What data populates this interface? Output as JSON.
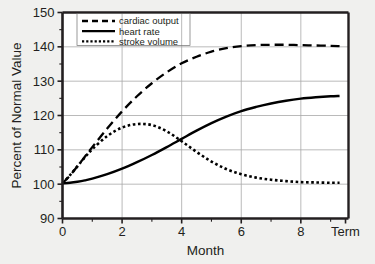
{
  "figure": {
    "background_color": "#f0f0ee",
    "plot_background_color": "#ffffff",
    "axis_color": "#231f20",
    "grid_color": "#a8a8a8"
  },
  "legend": {
    "position": "top-left-inside",
    "border": true,
    "items": [
      {
        "label": "cardiac output",
        "style": "dashed",
        "color": "#000000"
      },
      {
        "label": "heart rate",
        "style": "solid",
        "color": "#000000"
      },
      {
        "label": "stroke volume",
        "style": "dotted",
        "color": "#000000"
      }
    ]
  },
  "chart_data": {
    "type": "line",
    "title": "",
    "subtitle": "",
    "xlabel": "Month",
    "ylabel": "Percent of Normal Value",
    "xlim": [
      0,
      9.6
    ],
    "ylim": [
      90,
      150
    ],
    "yticks": [
      90,
      100,
      110,
      120,
      130,
      140,
      150
    ],
    "ytick_labels": [
      "90",
      "100",
      "110",
      "120",
      "130",
      "140",
      "150"
    ],
    "xticks": [
      0,
      2,
      4,
      6,
      8,
      9.5
    ],
    "xtick_labels": [
      "0",
      "2",
      "4",
      "6",
      "8",
      "Term"
    ],
    "xminor_ticks": [
      1,
      3,
      5,
      7,
      9
    ],
    "grid": true,
    "grid_axis": "both",
    "legend_position": "upper left",
    "series": [
      {
        "name": "cardiac output",
        "style": "dashed",
        "color": "#000000",
        "x": [
          0,
          0.25,
          0.5,
          0.75,
          1,
          1.5,
          2,
          2.5,
          3,
          3.5,
          4,
          4.5,
          5,
          5.5,
          6,
          6.5,
          7,
          7.5,
          8,
          8.5,
          9,
          9.3
        ],
        "y": [
          100.3,
          102.5,
          105.2,
          108.0,
          110.8,
          116.2,
          121.2,
          125.6,
          129.4,
          132.6,
          135.2,
          137.1,
          138.6,
          139.6,
          140.2,
          140.5,
          140.6,
          140.6,
          140.5,
          140.4,
          140.3,
          140.2
        ]
      },
      {
        "name": "heart rate",
        "style": "solid",
        "color": "#000000",
        "x": [
          0,
          0.25,
          0.5,
          0.75,
          1,
          1.5,
          2,
          2.5,
          3,
          3.5,
          4,
          4.5,
          5,
          5.5,
          6,
          6.5,
          7,
          7.5,
          8,
          8.5,
          9,
          9.3
        ],
        "y": [
          100.2,
          100.4,
          100.7,
          101.1,
          101.6,
          102.9,
          104.5,
          106.4,
          108.5,
          110.8,
          113.2,
          115.6,
          117.8,
          119.7,
          121.3,
          122.5,
          123.5,
          124.3,
          124.9,
          125.3,
          125.6,
          125.7
        ]
      },
      {
        "name": "stroke volume",
        "style": "dotted",
        "color": "#000000",
        "x": [
          0,
          0.25,
          0.5,
          0.75,
          1,
          1.5,
          2,
          2.5,
          3,
          3.5,
          4,
          4.5,
          5,
          5.5,
          6,
          6.5,
          7,
          7.5,
          8,
          8.5,
          9,
          9.3
        ],
        "y": [
          100.2,
          102.6,
          105.2,
          107.8,
          110.2,
          114.0,
          116.5,
          117.5,
          117.2,
          115.4,
          112.5,
          109.4,
          106.6,
          104.4,
          102.9,
          101.9,
          101.3,
          100.9,
          100.6,
          100.5,
          100.4,
          100.4
        ]
      }
    ],
    "annotations": [
      {
        "text": "stroke volume peaks near month 2.5 at ~117.5%"
      },
      {
        "text": "cardiac output plateaus near 140% after month 6"
      }
    ]
  }
}
